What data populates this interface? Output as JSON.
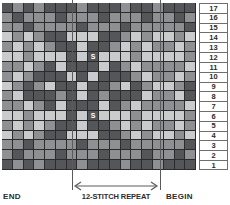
{
  "chart_data": {
    "type": "heatmap",
    "title": "",
    "xlabel": "12-STITCH REPEAT",
    "ylabel": "",
    "columns": 18,
    "rows": 17,
    "row_numbers": [
      17,
      16,
      15,
      14,
      13,
      12,
      11,
      10,
      9,
      8,
      7,
      6,
      5,
      4,
      3,
      2,
      1
    ],
    "palette": {
      "d": "#55565a",
      "m": "#8e9094",
      "l": "#c9cbcc"
    },
    "legend": [
      "dark",
      "medium",
      "light"
    ],
    "grid": true,
    "repeat_start_column": 7,
    "repeat_end_column": 15,
    "annotations": [
      {
        "label": "S",
        "row": 12,
        "column": 9
      },
      {
        "label": "S",
        "row": 6,
        "column": 9
      }
    ],
    "cells": [
      [
        "d",
        "m",
        "d",
        "m",
        "d",
        "d",
        "d",
        "m",
        "d",
        "d",
        "d",
        "m",
        "d",
        "d",
        "m",
        "d",
        "d",
        "d"
      ],
      [
        "m",
        "d",
        "m",
        "m",
        "m",
        "d",
        "m",
        "m",
        "m",
        "d",
        "m",
        "m",
        "m",
        "d",
        "m",
        "m",
        "d",
        "m"
      ],
      [
        "m",
        "m",
        "d",
        "m",
        "m",
        "m",
        "m",
        "d",
        "m",
        "m",
        "m",
        "d",
        "m",
        "m",
        "m",
        "m",
        "m",
        "d"
      ],
      [
        "l",
        "m",
        "l",
        "m",
        "d",
        "d",
        "l",
        "l",
        "l",
        "d",
        "d",
        "m",
        "l",
        "m",
        "l",
        "l",
        "m",
        "l"
      ],
      [
        "m",
        "l",
        "m",
        "l",
        "m",
        "d",
        "d",
        "l",
        "d",
        "d",
        "m",
        "l",
        "m",
        "l",
        "m",
        "m",
        "l",
        "m"
      ],
      [
        "l",
        "l",
        "m",
        "l",
        "l",
        "l",
        "d",
        "l",
        "d",
        "l",
        "l",
        "l",
        "m",
        "l",
        "l",
        "l",
        "l",
        "m"
      ],
      [
        "m",
        "m",
        "l",
        "m",
        "d",
        "l",
        "d",
        "d",
        "d",
        "l",
        "d",
        "m",
        "l",
        "m",
        "m",
        "m",
        "m",
        "l"
      ],
      [
        "m",
        "l",
        "m",
        "d",
        "d",
        "d",
        "l",
        "d",
        "l",
        "d",
        "d",
        "d",
        "m",
        "l",
        "m",
        "m",
        "l",
        "m"
      ],
      [
        "l",
        "m",
        "d",
        "m",
        "l",
        "d",
        "d",
        "l",
        "d",
        "d",
        "m",
        "l",
        "d",
        "m",
        "l",
        "l",
        "m",
        "d"
      ],
      [
        "m",
        "l",
        "d",
        "d",
        "d",
        "m",
        "d",
        "l",
        "d",
        "m",
        "d",
        "d",
        "d",
        "l",
        "m",
        "m",
        "l",
        "d"
      ],
      [
        "m",
        "m",
        "l",
        "m",
        "d",
        "l",
        "d",
        "d",
        "d",
        "l",
        "d",
        "m",
        "l",
        "m",
        "m",
        "m",
        "m",
        "l"
      ],
      [
        "l",
        "l",
        "m",
        "l",
        "l",
        "l",
        "d",
        "l",
        "d",
        "l",
        "l",
        "l",
        "m",
        "l",
        "l",
        "l",
        "l",
        "m"
      ],
      [
        "m",
        "l",
        "m",
        "l",
        "m",
        "d",
        "d",
        "l",
        "d",
        "d",
        "m",
        "l",
        "m",
        "l",
        "m",
        "m",
        "l",
        "m"
      ],
      [
        "l",
        "m",
        "l",
        "m",
        "d",
        "d",
        "l",
        "l",
        "l",
        "d",
        "d",
        "m",
        "l",
        "m",
        "l",
        "l",
        "m",
        "l"
      ],
      [
        "m",
        "m",
        "d",
        "m",
        "m",
        "m",
        "m",
        "d",
        "m",
        "m",
        "m",
        "d",
        "m",
        "m",
        "m",
        "m",
        "m",
        "d"
      ],
      [
        "m",
        "d",
        "m",
        "m",
        "m",
        "d",
        "m",
        "m",
        "m",
        "d",
        "m",
        "m",
        "m",
        "d",
        "m",
        "m",
        "d",
        "m"
      ],
      [
        "d",
        "m",
        "d",
        "m",
        "d",
        "d",
        "d",
        "m",
        "d",
        "d",
        "d",
        "m",
        "d",
        "d",
        "m",
        "d",
        "d",
        "d"
      ]
    ]
  },
  "labels": {
    "end": "END",
    "repeat": "12-STITCH REPEAT",
    "begin": "BEGIN"
  }
}
